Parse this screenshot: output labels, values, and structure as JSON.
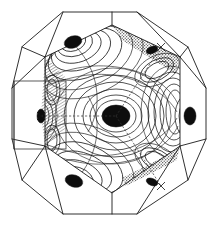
{
  "figure": {
    "background_color": "#ffffff",
    "line_color": "#1a1a1a",
    "contour_color": "#111111",
    "blob_color": "#0d0d0d",
    "width": 224,
    "height": 225
  },
  "chart_data": {
    "type": "contour",
    "xlabel": "",
    "ylabel": "",
    "grid": false,
    "legend": "none",
    "axis_ranges": {
      "x": [
        0,
        224
      ],
      "y": [
        0,
        225
      ]
    },
    "outer_zone_polygon": [
      [
        63,
        12
      ],
      [
        137,
        12
      ],
      [
        188,
        47
      ],
      [
        206,
        88
      ],
      [
        206,
        139
      ],
      [
        188,
        180
      ],
      [
        137,
        214
      ],
      [
        63,
        214
      ],
      [
        22,
        180
      ],
      [
        12,
        139
      ],
      [
        12,
        88
      ],
      [
        22,
        47
      ]
    ],
    "inner_hexagon_polygon": [
      [
        45,
        57
      ],
      [
        112,
        25
      ],
      [
        180,
        57
      ],
      [
        180,
        146
      ],
      [
        112,
        193
      ],
      [
        45,
        146
      ]
    ],
    "maxima": [
      {
        "label": "center-maximum",
        "x": 116,
        "y": 116,
        "rx": 14,
        "ry": 11,
        "intensity": 1.0
      },
      {
        "label": "upper-left-maximum",
        "x": 73,
        "y": 42,
        "rx": 9,
        "ry": 6,
        "intensity": 0.92
      },
      {
        "label": "lower-left-maximum",
        "x": 74,
        "y": 181,
        "rx": 9,
        "ry": 6,
        "intensity": 0.92
      },
      {
        "label": "right-maximum",
        "x": 190,
        "y": 116,
        "rx": 6,
        "ry": 9,
        "intensity": 0.9
      },
      {
        "label": "left-edge-maximum",
        "x": 41,
        "y": 116,
        "rx": 4,
        "ry": 7,
        "intensity": 0.85
      }
    ],
    "shaded_regions": [
      {
        "label": "upper-right-stipple",
        "pattern": "stipple"
      },
      {
        "label": "lower-right-stipple",
        "pattern": "stipple"
      },
      {
        "label": "left-face-hatch",
        "pattern": "hatch"
      }
    ],
    "symmetry_lines": [
      {
        "label": "horizontal-dashed-axis",
        "from": [
          41,
          116
        ],
        "to": [
          116,
          116
        ],
        "style": "dashed"
      },
      {
        "label": "upper-right-dashed-edge",
        "from": [
          116,
          116
        ],
        "to": [
          161,
          47
        ],
        "style": "dashed"
      },
      {
        "label": "lower-right-dashed-edge",
        "from": [
          116,
          116
        ],
        "to": [
          161,
          186
        ],
        "style": "dashed"
      }
    ],
    "markers": [
      {
        "label": "x-marker-left",
        "x": 41,
        "y": 116,
        "glyph": "x"
      },
      {
        "label": "x-marker-upper-right",
        "x": 161,
        "y": 47,
        "glyph": "x"
      },
      {
        "label": "x-marker-lower-right",
        "x": 161,
        "y": 186,
        "glyph": "x"
      }
    ],
    "inset_box": {
      "label": "left-rectangular-inset",
      "x": 14,
      "y": 81,
      "width": 52,
      "height": 68
    },
    "contour_levels": 12
  }
}
